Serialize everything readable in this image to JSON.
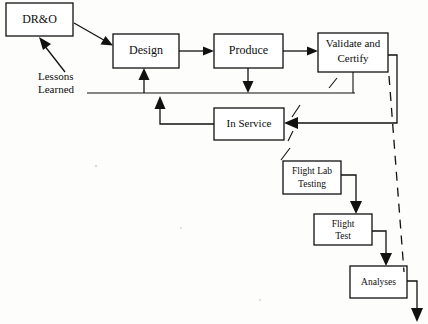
{
  "diagram": {
    "background_color": "#fdfdfb",
    "line_color": "#111111",
    "box_fill": "#ffffff",
    "nodes": [
      {
        "id": "dro",
        "label": "DR&O",
        "x": 6,
        "y": 3,
        "w": 67,
        "h": 33,
        "font_size": 12
      },
      {
        "id": "design",
        "label": "Design",
        "x": 113,
        "y": 34,
        "w": 66,
        "h": 34,
        "font_size": 12
      },
      {
        "id": "produce",
        "label": "Produce",
        "x": 214,
        "y": 34,
        "w": 69,
        "h": 34,
        "font_size": 12
      },
      {
        "id": "validate",
        "label_line1": "Validate and",
        "label_line2": "Certify",
        "x": 318,
        "y": 33,
        "w": 70,
        "h": 39,
        "font_size": 11
      },
      {
        "id": "inservice",
        "label": "In Service",
        "x": 214,
        "y": 108,
        "w": 70,
        "h": 32,
        "font_size": 11
      },
      {
        "id": "flightlab",
        "label_line1": "Flight  Lab",
        "label_line2": "Testing",
        "x": 283,
        "y": 161,
        "w": 58,
        "h": 33,
        "font_size": 9.5
      },
      {
        "id": "flighttest",
        "label_line1": "Flight",
        "label_line2": "Test",
        "x": 314,
        "y": 214,
        "w": 58,
        "h": 31,
        "font_size": 9.5
      },
      {
        "id": "analyses",
        "label": "Analyses",
        "x": 350,
        "y": 266,
        "w": 57,
        "h": 32,
        "font_size": 9.5
      }
    ],
    "free_labels": [
      {
        "id": "lessons-learned-1",
        "text": "Lessons",
        "x": 38,
        "y": 80,
        "font_size": 11
      },
      {
        "id": "lessons-learned-2",
        "text": "Learned",
        "x": 38,
        "y": 93,
        "font_size": 11
      }
    ],
    "connections": [
      {
        "id": "dro-to-design",
        "from": "DR&O",
        "to": "Design",
        "style": "solid"
      },
      {
        "id": "design-to-produce",
        "from": "Design",
        "to": "Produce",
        "style": "solid"
      },
      {
        "id": "produce-to-validate",
        "from": "Produce",
        "to": "Validate and Certify",
        "style": "solid"
      },
      {
        "id": "lessons-to-dro",
        "from": "Lessons Learned",
        "to": "DR&O",
        "style": "solid"
      },
      {
        "id": "lessons-bus-to-design",
        "from": "Lessons Learned",
        "to": "Design",
        "style": "solid"
      },
      {
        "id": "produce-to-lessons-bus",
        "from": "Produce",
        "to": "Lessons Learned",
        "style": "solid"
      },
      {
        "id": "validate-to-lessons-bus",
        "from": "Validate and Certify",
        "to": "Lessons Learned",
        "style": "solid"
      },
      {
        "id": "validate-to-inservice",
        "from": "Validate and Certify",
        "to": "In Service",
        "style": "solid"
      },
      {
        "id": "inservice-to-design",
        "from": "In Service",
        "to": "Design",
        "style": "solid"
      },
      {
        "id": "flightlab-to-flighttest",
        "from": "Flight Lab Testing",
        "to": "Flight Test",
        "style": "solid"
      },
      {
        "id": "flighttest-to-analyses",
        "from": "Flight Test",
        "to": "Analyses",
        "style": "solid"
      },
      {
        "id": "analyses-output",
        "from": "Analyses",
        "to": "",
        "style": "solid"
      },
      {
        "id": "certification-dashed",
        "from": "Validate and Certify",
        "to": "Analyses",
        "style": "dashed"
      }
    ]
  }
}
